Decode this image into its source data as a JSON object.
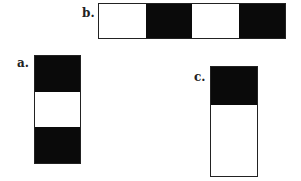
{
  "figures": [
    {
      "id": "a",
      "label": "a.",
      "orientation": "vertical",
      "segments": [
        "black",
        "white",
        "black"
      ],
      "weights": [
        1,
        1,
        1
      ]
    },
    {
      "id": "b",
      "label": "b.",
      "orientation": "horizontal",
      "segments": [
        "white",
        "black",
        "white",
        "black"
      ],
      "weights": [
        1,
        1,
        1,
        1
      ]
    },
    {
      "id": "c",
      "label": "c.",
      "orientation": "vertical",
      "segments": [
        "black",
        "white"
      ],
      "weights": [
        1,
        1.9
      ]
    }
  ],
  "colors": {
    "black": "#0a0a0a",
    "white": "#ffffff",
    "border": "#222222"
  }
}
